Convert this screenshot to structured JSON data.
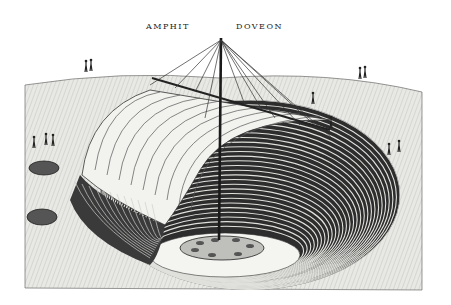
{
  "image": {
    "type": "engraving",
    "subject": "cut-away view of a sunken amphitheatre pit covered by an awning supported on a central mast with rigging",
    "caption_parts": [
      "AMPHIT",
      "DOVEON"
    ],
    "palette": {
      "paper": "#ffffff",
      "ground": "#e6e6e2",
      "ink": "#1e1e1e",
      "tiers": "#3a3a3a",
      "awning": "#f2f2ef"
    },
    "elements": [
      "central mast",
      "radiating rigging ropes",
      "striped awning (velarium)",
      "concentric tiered seating",
      "circular arena floor with round platform",
      "two small pits on left",
      "groups of figures on the ground"
    ]
  }
}
